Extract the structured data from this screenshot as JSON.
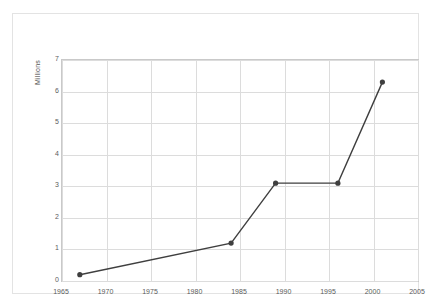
{
  "chart_data": {
    "type": "line",
    "title": "",
    "xlabel": "",
    "ylabel": "Millions",
    "xlim": [
      1965,
      2005
    ],
    "ylim": [
      0,
      7
    ],
    "grid": true,
    "legend": "none",
    "xticks": [
      "1965",
      "1970",
      "1975",
      "1980",
      "1985",
      "1990",
      "1995",
      "2000",
      "2005"
    ],
    "yticks": [
      "0",
      "1",
      "2",
      "3",
      "4",
      "5",
      "6",
      "7"
    ],
    "series": [
      {
        "name": "Millions",
        "color": "#3f3f3f",
        "marker": "circle",
        "x": [
          1967,
          1984,
          1989,
          1996,
          2001
        ],
        "values": [
          0.2,
          1.2,
          3.1,
          3.1,
          6.3
        ]
      }
    ]
  }
}
